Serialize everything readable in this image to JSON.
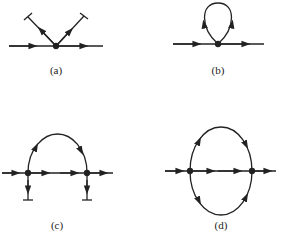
{
  "figure": {
    "panels": [
      {
        "id": "a",
        "label": "(a)",
        "description": "vertex with incoming and outgoing line and two outgoing terminated legs"
      },
      {
        "id": "b",
        "label": "(b)",
        "description": "tadpole: single vertex with closed loop"
      },
      {
        "id": "c",
        "label": "(c)",
        "description": "two vertices joined by an arc and a straight propagator, each with a downward terminated leg"
      },
      {
        "id": "d",
        "label": "(d)",
        "description": "two vertices joined by three propagators (sunset diagram)"
      }
    ],
    "colors": {
      "line": "#222222",
      "background": "#ffffff"
    }
  }
}
